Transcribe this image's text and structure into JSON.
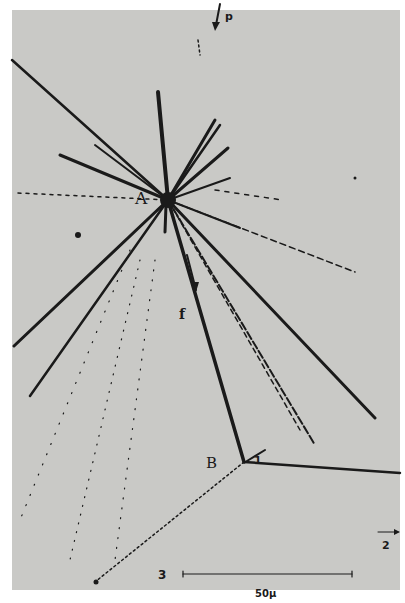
{
  "image": {
    "description": "Nuclear emulsion micrograph showing particle tracks radiating from star A, with a track terminating at B and decaying",
    "background_color": "#c9c9c6",
    "track_color": "#1a1a1a"
  },
  "labels": {
    "star_A": "A",
    "point_B": "B",
    "primary_p": "p",
    "track_f": "f",
    "track_1": "1",
    "track_2": "2",
    "track_3": "3"
  },
  "scale_bar": {
    "label": "50μ"
  }
}
